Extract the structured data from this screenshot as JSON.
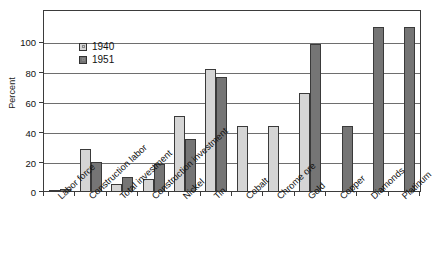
{
  "chart_data": {
    "type": "bar",
    "title": "",
    "xlabel": "",
    "ylabel": "Percent",
    "ylim": [
      0,
      110
    ],
    "yticks": [
      0,
      20,
      40,
      60,
      80,
      100
    ],
    "grid": true,
    "legend_position": "top-left inside plot",
    "categories": [
      "Labor force",
      "Construction labor",
      "Total investment",
      "Construction investment",
      "Nickel",
      "Tin",
      "Cobalt",
      "Chrome ore",
      "Gold",
      "Copper",
      "Diamonds",
      "Platinum"
    ],
    "series": [
      {
        "name": "1940",
        "color": "#d5d5d5",
        "values": [
          1,
          26,
          5,
          8,
          46,
          75,
          40,
          40,
          60,
          0,
          0,
          0
        ]
      },
      {
        "name": "1951",
        "color": "#757575",
        "values": [
          2,
          18,
          9,
          17,
          32,
          70,
          0,
          0,
          90,
          40,
          100,
          100
        ]
      }
    ]
  },
  "axis": {
    "y_title": "Percent",
    "y_tick_labels": [
      "100",
      "80",
      "60",
      "40",
      "20",
      "0"
    ]
  },
  "legend": {
    "items": [
      {
        "label": "1940",
        "swatch": "light-gray-swatch"
      },
      {
        "label": "1951",
        "swatch": "dark-gray-swatch"
      }
    ]
  },
  "colors": {
    "series_1940": "#d5d5d5",
    "series_1951": "#757575",
    "axis": "#3b3b3b",
    "grid": "#6e6e6e",
    "background": "#ffffff"
  }
}
